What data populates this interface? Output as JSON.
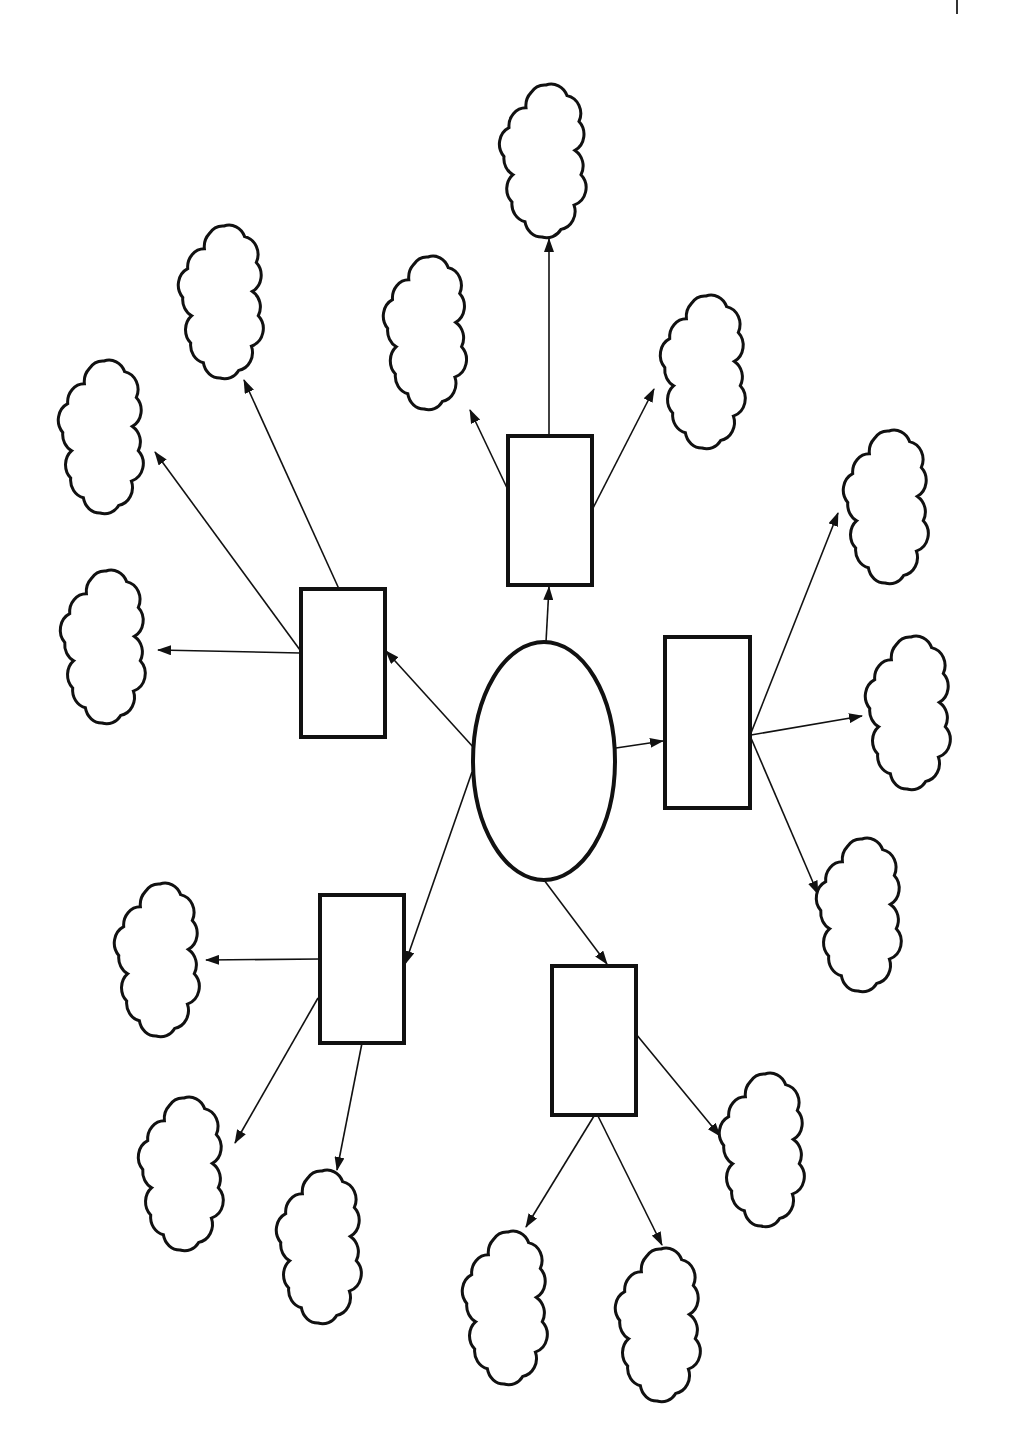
{
  "page": {
    "width": 1018,
    "height": 1454,
    "background": "#ffffff",
    "stroke_color": "#111111"
  },
  "diagram": {
    "type": "spider-map",
    "center": {
      "id": "center",
      "shape": "ellipse",
      "cx": 544,
      "cy": 761,
      "rx": 71,
      "ry": 119,
      "label": ""
    },
    "branches": [
      {
        "id": "b-top",
        "shape": "rect",
        "x": 508,
        "y": 436,
        "w": 84,
        "h": 149,
        "label": "",
        "edge_from_center": {
          "x1": 546,
          "y1": 642,
          "x2": 549,
          "y2": 587
        }
      },
      {
        "id": "b-left",
        "shape": "rect",
        "x": 301,
        "y": 589,
        "w": 84,
        "h": 148,
        "label": "",
        "edge_from_center": {
          "x1": 474,
          "y1": 748,
          "x2": 386,
          "y2": 651
        }
      },
      {
        "id": "b-right",
        "shape": "rect",
        "x": 665,
        "y": 637,
        "w": 85,
        "h": 171,
        "label": "",
        "edge_from_center": {
          "x1": 616,
          "y1": 748,
          "x2": 663,
          "y2": 741
        }
      },
      {
        "id": "b-bottom-left",
        "shape": "rect",
        "x": 320,
        "y": 895,
        "w": 84,
        "h": 148,
        "label": "",
        "edge_from_center": {
          "x1": 472,
          "y1": 772,
          "x2": 405,
          "y2": 964
        }
      },
      {
        "id": "b-bottom",
        "shape": "rect",
        "x": 552,
        "y": 966,
        "w": 84,
        "h": 149,
        "label": "",
        "edge_from_center": {
          "x1": 544,
          "y1": 880,
          "x2": 607,
          "y2": 964
        }
      }
    ],
    "clouds": [
      {
        "id": "c1",
        "parent": "b-top",
        "cx": 546,
        "cy": 161,
        "w": 100,
        "h": 152,
        "label": "",
        "edge": {
          "x1": 549,
          "y1": 436,
          "x2": 549,
          "y2": 239
        }
      },
      {
        "id": "c2",
        "parent": "b-top",
        "cx": 428,
        "cy": 333,
        "w": 96,
        "h": 152,
        "label": "",
        "edge": {
          "x1": 508,
          "y1": 490,
          "x2": 470,
          "y2": 410
        }
      },
      {
        "id": "c3",
        "parent": "b-top",
        "cx": 706,
        "cy": 372,
        "w": 98,
        "h": 152,
        "label": "",
        "edge": {
          "x1": 592,
          "y1": 510,
          "x2": 654,
          "y2": 389
        }
      },
      {
        "id": "c4",
        "parent": "b-left",
        "cx": 224,
        "cy": 302,
        "w": 98,
        "h": 152,
        "label": "",
        "edge": {
          "x1": 339,
          "y1": 589,
          "x2": 244,
          "y2": 380
        }
      },
      {
        "id": "c5",
        "parent": "b-left",
        "cx": 104,
        "cy": 437,
        "w": 98,
        "h": 152,
        "label": "",
        "edge": {
          "x1": 300,
          "y1": 650,
          "x2": 155,
          "y2": 452
        }
      },
      {
        "id": "c6",
        "parent": "b-left",
        "cx": 106,
        "cy": 647,
        "w": 98,
        "h": 152,
        "label": "",
        "edge": {
          "x1": 300,
          "y1": 653,
          "x2": 158,
          "y2": 650
        }
      },
      {
        "id": "c7",
        "parent": "b-right",
        "cx": 889,
        "cy": 507,
        "w": 98,
        "h": 152,
        "label": "",
        "edge": {
          "x1": 751,
          "y1": 733,
          "x2": 838,
          "y2": 513
        }
      },
      {
        "id": "c8",
        "parent": "b-right",
        "cx": 911,
        "cy": 713,
        "w": 98,
        "h": 152,
        "label": "",
        "edge": {
          "x1": 751,
          "y1": 735,
          "x2": 862,
          "y2": 716
        }
      },
      {
        "id": "c9",
        "parent": "b-right",
        "cx": 862,
        "cy": 915,
        "w": 98,
        "h": 152,
        "label": "",
        "edge": {
          "x1": 751,
          "y1": 738,
          "x2": 818,
          "y2": 894
        }
      },
      {
        "id": "c10",
        "parent": "b-bottom-left",
        "cx": 160,
        "cy": 960,
        "w": 98,
        "h": 152,
        "label": "",
        "edge": {
          "x1": 320,
          "y1": 959,
          "x2": 206,
          "y2": 960
        }
      },
      {
        "id": "c11",
        "parent": "b-bottom-left",
        "cx": 184,
        "cy": 1174,
        "w": 98,
        "h": 152,
        "label": "",
        "edge": {
          "x1": 318,
          "y1": 998,
          "x2": 235,
          "y2": 1143
        }
      },
      {
        "id": "c12",
        "parent": "b-bottom-left",
        "cx": 322,
        "cy": 1247,
        "w": 98,
        "h": 152,
        "label": "",
        "edge": {
          "x1": 362,
          "y1": 1043,
          "x2": 337,
          "y2": 1170
        }
      },
      {
        "id": "c13",
        "parent": "b-bottom",
        "cx": 765,
        "cy": 1150,
        "w": 98,
        "h": 152,
        "label": "",
        "edge": {
          "x1": 636,
          "y1": 1034,
          "x2": 720,
          "y2": 1136
        }
      },
      {
        "id": "c14",
        "parent": "b-bottom",
        "cx": 508,
        "cy": 1308,
        "w": 98,
        "h": 152,
        "label": "",
        "edge": {
          "x1": 594,
          "y1": 1116,
          "x2": 526,
          "y2": 1227
        }
      },
      {
        "id": "c15",
        "parent": "b-bottom",
        "cx": 661,
        "cy": 1325,
        "w": 98,
        "h": 152,
        "label": "",
        "edge": {
          "x1": 598,
          "y1": 1116,
          "x2": 662,
          "y2": 1245
        }
      }
    ]
  }
}
